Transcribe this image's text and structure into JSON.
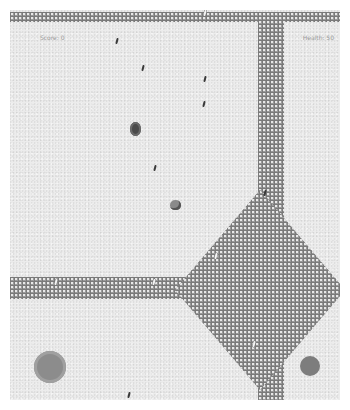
{
  "hud": {
    "score_label": "Score: 0",
    "health_label": "Health: 50"
  },
  "controls": {
    "joystick": "virtual-joystick",
    "fire_button": "fire-button"
  },
  "colors": {
    "background": "#ececec",
    "wall": "#9a9a9a",
    "joystick": "#8c8c8c",
    "fire_button": "#7d7d7d"
  }
}
